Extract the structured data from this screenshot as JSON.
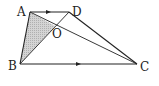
{
  "figure": {
    "type": "trapezoid-geometry",
    "points": {
      "A": {
        "label": "A"
      },
      "B": {
        "label": "B"
      },
      "C": {
        "label": "C"
      },
      "D": {
        "label": "D"
      },
      "O": {
        "label": "O"
      }
    },
    "segments": [
      "AD",
      "DC",
      "CB",
      "BA",
      "AC",
      "BD"
    ],
    "parallel_marks": [
      "AD",
      "BC"
    ],
    "shaded_region": "ABO",
    "colors": {
      "stroke": "#222222",
      "shade": "#c8c8c8"
    }
  }
}
